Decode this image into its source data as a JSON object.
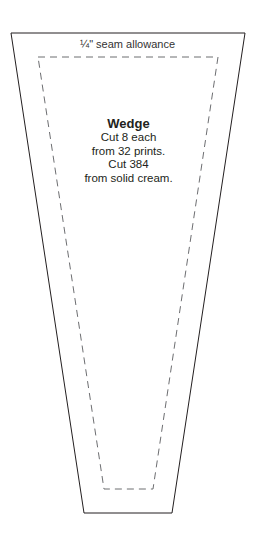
{
  "template": {
    "seam_label": "¼\" seam allowance",
    "piece_name": "Wedge",
    "instructions": [
      "Cut 8 each",
      "from 32 prints.",
      "Cut 384",
      "from solid cream."
    ],
    "outer_outline": {
      "top_left": [
        11,
        33
      ],
      "top_right": [
        245,
        33
      ],
      "bottom_right": [
        172,
        513
      ],
      "bottom_left": [
        84,
        513
      ],
      "style": "solid",
      "color": "#231f20"
    },
    "inner_outline": {
      "top_left": [
        38,
        57
      ],
      "top_right": [
        218,
        57
      ],
      "bottom_right": [
        153,
        489
      ],
      "bottom_left": [
        104,
        489
      ],
      "style": "dashed",
      "color": "#6d6e71"
    }
  }
}
